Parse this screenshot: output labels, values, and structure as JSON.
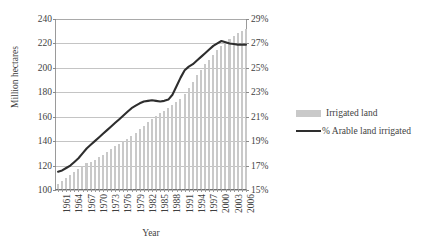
{
  "chart_data": {
    "type": "bar",
    "title": "",
    "xlabel": "Year",
    "ylabel": "Million hectares",
    "ylabel_right": "",
    "grid": true,
    "legend_position": "right",
    "ylim": [
      100,
      240
    ],
    "ylim_right": [
      15,
      29
    ],
    "yticks": [
      100,
      120,
      140,
      160,
      180,
      200,
      220,
      240
    ],
    "yticks_right": [
      "15%",
      "17%",
      "19%",
      "21%",
      "23%",
      "25%",
      "27%",
      "29%"
    ],
    "x": [
      1961,
      1962,
      1963,
      1964,
      1965,
      1966,
      1967,
      1968,
      1969,
      1970,
      1971,
      1972,
      1973,
      1974,
      1975,
      1976,
      1977,
      1978,
      1979,
      1980,
      1981,
      1982,
      1983,
      1984,
      1985,
      1986,
      1987,
      1988,
      1989,
      1990,
      1991,
      1992,
      1993,
      1994,
      1995,
      1996,
      1997,
      1998,
      1999,
      2000,
      2001,
      2002,
      2003,
      2004,
      2005,
      2006,
      2007
    ],
    "xtick_labels": [
      "1961",
      "1964",
      "1967",
      "1970",
      "1973",
      "1976",
      "1979",
      "1982",
      "1985",
      "1988",
      "1991",
      "1994",
      "1997",
      "2000",
      "2003",
      "2006"
    ],
    "series": [
      {
        "name": "Irrigated land",
        "axis": "left",
        "render": "bar",
        "color": "#c9c9c9",
        "values": [
          104.0,
          106.5,
          109.0,
          111.5,
          114.0,
          116.5,
          119.0,
          121.0,
          122.0,
          123.5,
          126.0,
          128.0,
          130.5,
          133.0,
          135.0,
          136.5,
          139.0,
          141.0,
          143.5,
          146.0,
          149.0,
          152.0,
          155.0,
          157.5,
          160.0,
          162.0,
          164.0,
          166.0,
          168.5,
          171.0,
          174.0,
          178.0,
          183.0,
          188.0,
          193.0,
          197.5,
          202.0,
          206.0,
          210.0,
          214.0,
          217.0,
          220.0,
          223.0,
          225.5,
          227.5,
          229.5,
          231.0
        ]
      },
      {
        "name": "% Arable land irrigated",
        "axis": "right",
        "render": "line",
        "color": "#2e2e2e",
        "values": [
          16.5,
          16.6,
          16.8,
          17.0,
          17.3,
          17.6,
          18.0,
          18.4,
          18.7,
          19.0,
          19.3,
          19.6,
          19.9,
          20.2,
          20.5,
          20.8,
          21.1,
          21.4,
          21.7,
          21.9,
          22.1,
          22.25,
          22.3,
          22.35,
          22.3,
          22.25,
          22.3,
          22.4,
          22.8,
          23.5,
          24.2,
          24.8,
          25.1,
          25.3,
          25.6,
          25.9,
          26.2,
          26.5,
          26.8,
          27.0,
          27.2,
          27.1,
          27.0,
          26.95,
          26.9,
          26.9,
          26.9
        ]
      }
    ]
  },
  "legend": {
    "items": [
      {
        "label": "Irrigated land",
        "swatch": "bar-swatch"
      },
      {
        "label": "% Arable land irrigated",
        "swatch": "line-swatch"
      }
    ]
  }
}
